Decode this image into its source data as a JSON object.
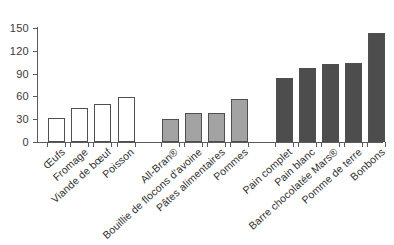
{
  "chart_data": {
    "type": "bar",
    "title": "",
    "subtitle": "",
    "xlabel": "",
    "ylabel": "",
    "ylim": [
      0,
      150
    ],
    "yticks": [
      0,
      30,
      60,
      90,
      120,
      150
    ],
    "grid": false,
    "legend": "none",
    "categories": [
      "Œufs",
      "Fromage",
      "Viande de bœuf",
      "Poisson",
      "All-Bran®",
      "Bouillie de flocons d'avoine",
      "Pâtes alimentaires",
      "Pommes",
      "Pain complet",
      "Pain blanc",
      "Barre chocolatée Mars®",
      "Pomme de terre",
      "Bonbons"
    ],
    "values": [
      31,
      45,
      50,
      59,
      30,
      38,
      38,
      57,
      84,
      97,
      103,
      104,
      143
    ],
    "bar_fills": [
      "#ffffff",
      "#ffffff",
      "#ffffff",
      "#ffffff",
      "#a3a3a3",
      "#a3a3a3",
      "#a3a3a3",
      "#a3a3a3",
      "#4d4d4d",
      "#4d4d4d",
      "#4d4d4d",
      "#4d4d4d",
      "#4d4d4d"
    ],
    "group_index": [
      0,
      0,
      0,
      0,
      1,
      1,
      1,
      1,
      2,
      2,
      2,
      2,
      2
    ],
    "groups": [
      {
        "name": "groupe-clair",
        "color": "#ffffff"
      },
      {
        "name": "groupe-gris",
        "color": "#a3a3a3"
      },
      {
        "name": "groupe-fonce",
        "color": "#4d4d4d"
      }
    ],
    "colors": {
      "axis": "#5a5a5a",
      "bar_outline": "#4f4f4f",
      "text": "#2f2f2f",
      "background": "#ffffff"
    }
  }
}
